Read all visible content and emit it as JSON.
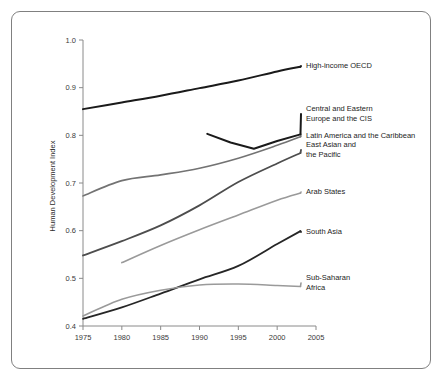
{
  "chart_data": {
    "type": "line",
    "title": "",
    "xlabel": "",
    "ylabel": "Human Development Index",
    "xlim": [
      1975,
      2005
    ],
    "ylim": [
      0.4,
      1.0
    ],
    "xticks": [
      "1975",
      "1980",
      "1985",
      "1990",
      "1995",
      "2000",
      "2005"
    ],
    "yticks": [
      "0.4",
      "0.5",
      "0.6",
      "0.7",
      "0.8",
      "0.9",
      "1.0"
    ],
    "grid": false,
    "legend": "inline-right-labels",
    "series": [
      {
        "name": "High-income OECD",
        "label_lines": [
          "High-income OECD"
        ],
        "color": "#1a1a1a",
        "width": 2.0,
        "x": [
          1975,
          1980,
          1985,
          1990,
          1995,
          2000,
          2003
        ],
        "values": [
          0.855,
          0.869,
          0.883,
          0.899,
          0.915,
          0.934,
          0.944
        ]
      },
      {
        "name": "Central and Eastern Europe and the CIS",
        "label_lines": [
          "Central and Eastern",
          "Europe and the CIS"
        ],
        "color": "#1a1a1a",
        "width": 2.0,
        "x": [
          1991,
          1994,
          1997,
          2000,
          2003
        ],
        "values": [
          0.803,
          0.785,
          0.772,
          0.788,
          0.802
        ]
      },
      {
        "name": "Latin America and the Caribbean",
        "label_lines": [
          "Latin America and the Caribbean"
        ],
        "color": "#737373",
        "width": 1.6,
        "x": [
          1975,
          1980,
          1985,
          1990,
          1995,
          2000,
          2003
        ],
        "values": [
          0.673,
          0.705,
          0.717,
          0.731,
          0.752,
          0.779,
          0.797
        ]
      },
      {
        "name": "East Asian and the Pacific",
        "label_lines": [
          "East Asian and",
          "the Pacific"
        ],
        "color": "#4d4d4d",
        "width": 1.8,
        "x": [
          1975,
          1980,
          1985,
          1990,
          1995,
          2000,
          2003
        ],
        "values": [
          0.548,
          0.578,
          0.611,
          0.653,
          0.702,
          0.741,
          0.763
        ]
      },
      {
        "name": "Arab States",
        "label_lines": [
          "Arab States"
        ],
        "color": "#9a9a9a",
        "width": 1.6,
        "x": [
          1980,
          1985,
          1990,
          1995,
          2000,
          2003
        ],
        "values": [
          0.533,
          0.569,
          0.602,
          0.633,
          0.664,
          0.679
        ]
      },
      {
        "name": "South Asia",
        "label_lines": [
          "South Asia"
        ],
        "color": "#262626",
        "width": 1.8,
        "x": [
          1975,
          1980,
          1985,
          1990,
          1995,
          2000,
          2003
        ],
        "values": [
          0.415,
          0.439,
          0.468,
          0.498,
          0.526,
          0.572,
          0.599
        ]
      },
      {
        "name": "Sub-Saharan Africa",
        "label_lines": [
          "Sub-Saharan",
          "Africa"
        ],
        "color": "#9a9a9a",
        "width": 1.6,
        "x": [
          1975,
          1980,
          1985,
          1990,
          1995,
          2000,
          2003
        ],
        "values": [
          0.421,
          0.456,
          0.475,
          0.486,
          0.488,
          0.485,
          0.483
        ]
      }
    ],
    "label_positions": [
      {
        "series": "High-income OECD",
        "x": 306,
        "y": 68
      },
      {
        "series": "Central and Eastern Europe and the CIS",
        "x": 306,
        "y": 116
      },
      {
        "series": "Latin America and the Caribbean",
        "x": 306,
        "y": 138
      },
      {
        "series": "East Asian and the Pacific",
        "x": 306,
        "y": 152
      },
      {
        "series": "Arab States",
        "x": 306,
        "y": 194
      },
      {
        "series": "South Asia",
        "x": 306,
        "y": 234
      },
      {
        "series": "Sub-Saharan Africa",
        "x": 306,
        "y": 285
      }
    ]
  },
  "colors": {
    "frame_border": "#808080",
    "axis": "#8a8a8a",
    "background": "#ffffff",
    "text": "#1d1d1d"
  }
}
